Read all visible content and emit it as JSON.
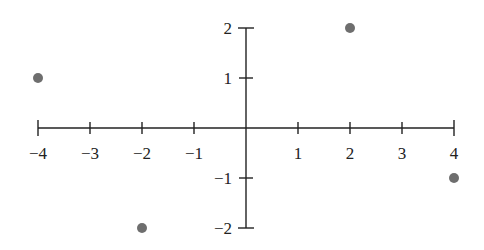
{
  "chart_data": {
    "type": "scatter",
    "title": "",
    "xlabel": "",
    "ylabel": "",
    "xlim": [
      -4,
      4
    ],
    "ylim": [
      -2,
      2
    ],
    "grid": false,
    "legend": null,
    "x_ticks": [
      -4,
      -3,
      -2,
      -1,
      1,
      2,
      3,
      4
    ],
    "x_tick_labels": [
      "−4",
      "−3",
      "−2",
      "−1",
      "1",
      "2",
      "3",
      "4"
    ],
    "y_ticks": [
      2,
      1,
      -1,
      -2
    ],
    "y_tick_labels": [
      "2",
      "1",
      "−1",
      "−2"
    ],
    "series": [
      {
        "name": "points",
        "points": [
          {
            "x": -4,
            "y": 1
          },
          {
            "x": 2,
            "y": 2
          },
          {
            "x": -2,
            "y": -2
          },
          {
            "x": 4,
            "y": -1
          }
        ]
      }
    ]
  },
  "colors": {
    "axis": "#222222",
    "point": "#6e6e6e",
    "text": "#222222"
  },
  "layout": {
    "origin_px": [
      246,
      128
    ],
    "x_unit_px": 52,
    "y_unit_px": 50,
    "point_radius": 5
  }
}
